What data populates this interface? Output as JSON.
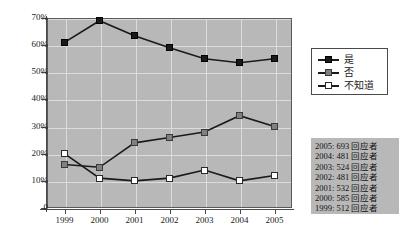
{
  "chart_data": {
    "type": "line",
    "title": "",
    "xlabel": "",
    "ylabel": "",
    "categories": [
      "1999",
      "2000",
      "2001",
      "2002",
      "2003",
      "2004",
      "2005"
    ],
    "ylim": [
      0,
      70
    ],
    "yticks": [
      0,
      10,
      20,
      30,
      40,
      50,
      60,
      70
    ],
    "ytick_labels": [
      "0",
      "10%",
      "20%",
      "30%",
      "40%",
      "50%",
      "60%",
      "70%"
    ],
    "grid": true,
    "legend_position": "right-top",
    "series": [
      {
        "name": "是",
        "color": "#1a1a1a",
        "marker": "filled-square-black",
        "values": [
          61,
          69,
          63.5,
          59,
          55,
          53.5,
          55
        ]
      },
      {
        "name": "否",
        "color": "#808080",
        "marker": "filled-square-gray",
        "values": [
          16,
          15,
          24,
          26,
          28,
          34,
          30
        ]
      },
      {
        "name": "不知道",
        "color": "#ffffff",
        "marker": "hollow-square",
        "values": [
          20,
          11,
          10,
          11,
          14,
          10,
          12
        ]
      }
    ]
  },
  "legend": {
    "items": [
      {
        "label": "是"
      },
      {
        "label": "否"
      },
      {
        "label": "不知道"
      }
    ]
  },
  "notes": {
    "lines": [
      "2005: 693 回应者",
      "2004: 481 回应者",
      "2003: 524 回应者",
      "2002: 481 回应者",
      "2001: 532 回应者",
      "2000: 585 回应者",
      "1999: 512 回应者"
    ]
  },
  "colors": {
    "plot_background": "#b8b8b8",
    "page_background": "#ffffff",
    "gridline": "#dcdcdc",
    "axis": "#4a4a4a",
    "series_yes": "#1a1a1a",
    "series_no": "#808080",
    "series_dont_know": "#ffffff"
  }
}
